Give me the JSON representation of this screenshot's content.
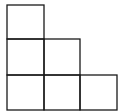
{
  "diagram": {
    "columns": [
      3,
      2,
      1
    ],
    "stroke_color": "#1a1a1a",
    "background": "#ffffff",
    "cells": [
      {
        "col": 0,
        "row": 0
      },
      {
        "col": 0,
        "row": 1
      },
      {
        "col": 1,
        "row": 1
      },
      {
        "col": 0,
        "row": 2
      },
      {
        "col": 1,
        "row": 2
      },
      {
        "col": 2,
        "row": 2
      }
    ]
  }
}
